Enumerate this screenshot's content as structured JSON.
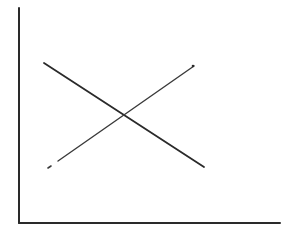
{
  "diagram": {
    "type": "line-diagram",
    "title": "",
    "labels": [],
    "axes": {
      "y_axis": {
        "x": 19,
        "y_top": 8,
        "y_bottom": 223,
        "label": ""
      },
      "x_axis": {
        "y": 223,
        "x_left": 19,
        "x_right": 280,
        "label": ""
      }
    },
    "lines": [
      {
        "name": "descending-line",
        "style": "solid",
        "from": [
          44,
          63
        ],
        "to": [
          204,
          167
        ],
        "color": "#2a2a2a"
      },
      {
        "name": "ascending-line",
        "style": "solid-with-dashed-tail",
        "from": [
          48,
          168
        ],
        "to": [
          194,
          66
        ],
        "color": "#3a3a3a"
      }
    ],
    "intersection": [
      124,
      115
    ],
    "colors": {
      "background": "#ffffff",
      "ink": "#2a2a2a"
    }
  }
}
